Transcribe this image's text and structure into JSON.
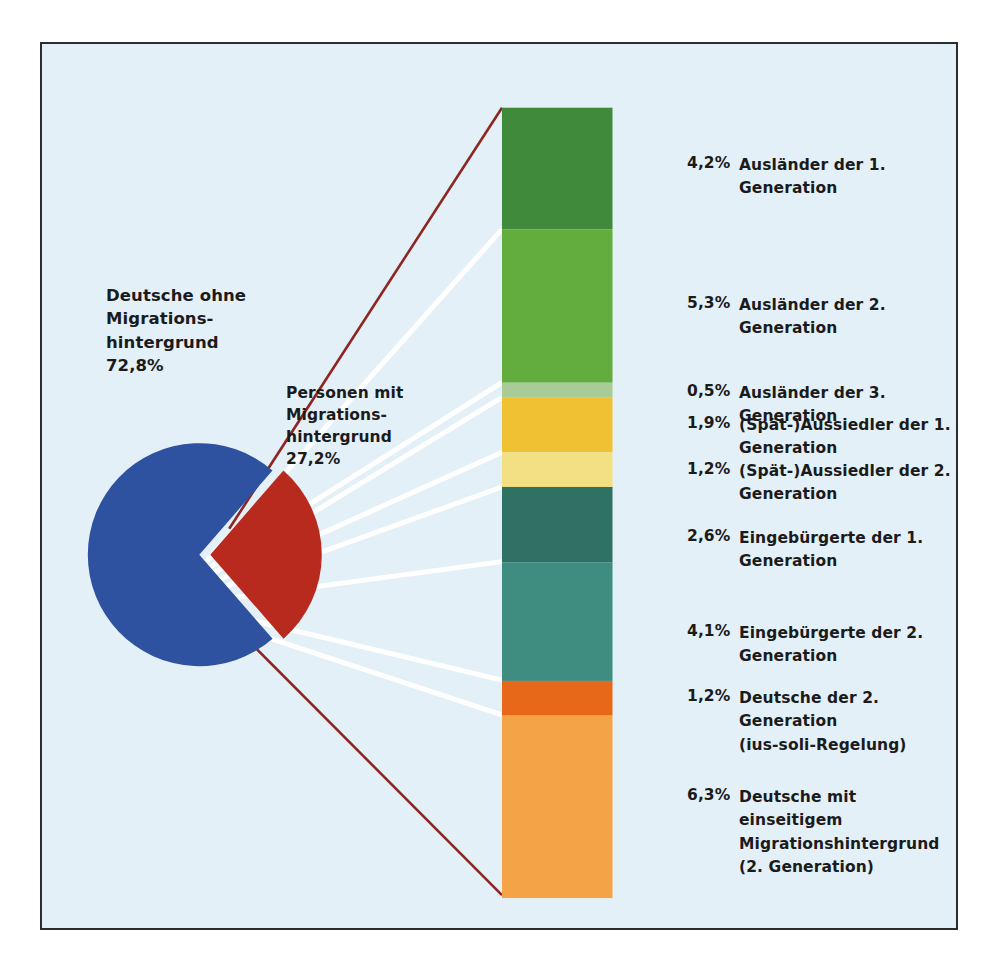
{
  "figure": {
    "background_color": "#e4f0f8",
    "border_color": "#2a2e31"
  },
  "pie": {
    "majority": {
      "label": "Deutsche ohne\nMigrations-\nhintergrund\n72,8%",
      "name": "Deutsche ohne Migrationshintergrund",
      "value": 72.8,
      "value_text": "72,8%",
      "color": "#2f52a0"
    },
    "migration": {
      "label": "Personen mit\nMigrations-\nhintergrund\n27,2%",
      "name": "Personen mit Migrationshintergrund",
      "value": 27.2,
      "value_text": "27,2%",
      "color": "#b82a1e"
    }
  },
  "bar": {
    "total_value": 27.2,
    "segments": [
      {
        "pct": "4,2%",
        "value": 4.2,
        "label": "Ausländer der 1. Generation",
        "color": "#3f8b3b"
      },
      {
        "pct": "5,3%",
        "value": 5.3,
        "label": "Ausländer der 2. Generation",
        "color": "#63ad3e"
      },
      {
        "pct": "0,5%",
        "value": 0.5,
        "label": "Ausländer der 3. Generation",
        "color": "#a9cc97"
      },
      {
        "pct": "1,9%",
        "value": 1.9,
        "label": "(Spät-)Aussiedler der 1. Generation",
        "color": "#f0c233"
      },
      {
        "pct": "1,2%",
        "value": 1.2,
        "label": "(Spät-)Aussiedler der 2. Generation",
        "color": "#f2e083"
      },
      {
        "pct": "2,6%",
        "value": 2.6,
        "label": "Eingebürgerte der 1. Generation",
        "color": "#2f7263"
      },
      {
        "pct": "4,1%",
        "value": 4.1,
        "label": "Eingebürgerte der 2. Generation",
        "color": "#3f8d80"
      },
      {
        "pct": "1,2%",
        "value": 1.2,
        "label": "Deutsche der 2. Generation\n(ius-soli-Regelung)",
        "color": "#e8681a"
      },
      {
        "pct": "6,3%",
        "value": 6.3,
        "label": "Deutsche mit einseitigem\nMigrationshintergrund\n(2. Generation)",
        "color": "#f5a347"
      }
    ]
  },
  "chart_data": {
    "type": "pie",
    "title": "",
    "xlabel": "",
    "ylabel": "",
    "legend_position": "right",
    "grid": false,
    "units": "percent of population",
    "categories": [
      "Deutsche ohne Migrationshintergrund",
      "Personen mit Migrationshintergrund"
    ],
    "values": [
      72.8,
      27.2
    ],
    "colors": [
      "#2f52a0",
      "#b82a1e"
    ],
    "exploded_slice": "Personen mit Migrationshintergrund",
    "breakout": {
      "type": "bar",
      "orientation": "vertical-stacked",
      "parent_slice": "Personen mit Migrationshintergrund",
      "parent_total": 27.2,
      "categories": [
        "Ausländer der 1. Generation",
        "Ausländer der 2. Generation",
        "Ausländer der 3. Generation",
        "(Spät-)Aussiedler der 1. Generation",
        "(Spät-)Aussiedler der 2. Generation",
        "Eingebürgerte der 1. Generation",
        "Eingebürgerte der 2. Generation",
        "Deutsche der 2. Generation (ius-soli-Regelung)",
        "Deutsche mit einseitigem Migrationshintergrund (2. Generation)"
      ],
      "values": [
        4.2,
        5.3,
        0.5,
        1.9,
        1.2,
        2.6,
        4.1,
        1.2,
        6.3
      ],
      "colors": [
        "#3f8b3b",
        "#63ad3e",
        "#a9cc97",
        "#f0c233",
        "#f2e083",
        "#2f7263",
        "#3f8d80",
        "#e8681a",
        "#f5a347"
      ]
    }
  }
}
